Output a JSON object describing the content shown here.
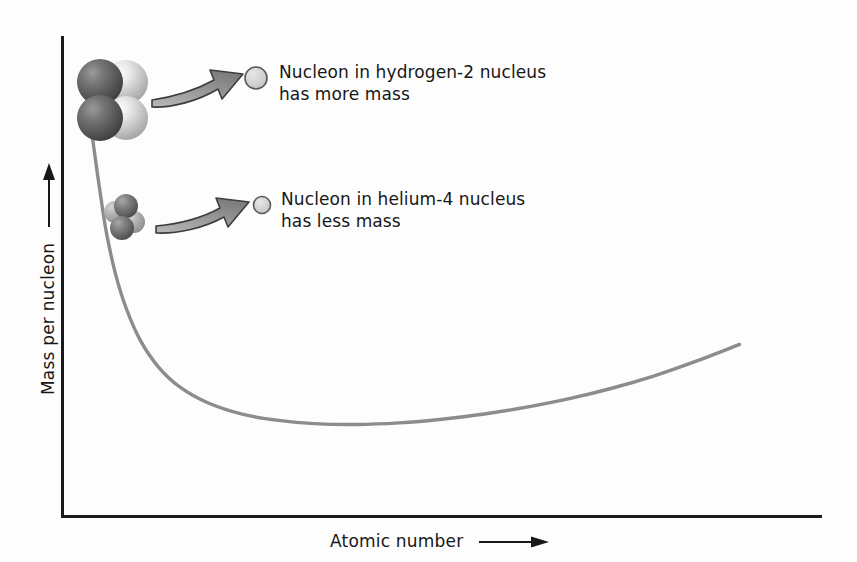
{
  "figure": {
    "background_color": "#fdfdfd",
    "curve_color": "#8c8c8c",
    "axis_color": "#1a1a1a",
    "text_color": "#171717",
    "arrow_fill": "#9a9a9a",
    "arrow_stroke": "#3d3d3d"
  },
  "axes": {
    "y_label": "Mass per nucleon",
    "x_label": "Atomic number",
    "y_arrow": "up-arrow",
    "x_arrow": "right-arrow"
  },
  "annotations": [
    {
      "id": "hydrogen",
      "line1": "Nucleon in hydrogen-2 nucleus",
      "line2": "has more mass",
      "cluster_label": "hydrogen-2-nucleus-cluster",
      "cluster_particles": 4,
      "callout_circle": "single-nucleon-circle-large"
    },
    {
      "id": "helium",
      "line1": "Nucleon in helium-4 nucleus",
      "line2": "has less mass",
      "cluster_label": "helium-4-nucleus-cluster",
      "cluster_particles": 4,
      "callout_circle": "single-nucleon-circle-small"
    }
  ],
  "chart_data": {
    "type": "line",
    "title": "",
    "xlabel": "Atomic number",
    "ylabel": "Mass per nucleon",
    "grid": false,
    "legend": "none",
    "axis_arrows": true,
    "tick_labels": [],
    "xlim": [
      0,
      100
    ],
    "ylim": [
      0,
      100
    ],
    "series": [
      {
        "name": "Mass per nucleon vs atomic number",
        "color": "#8c8c8c",
        "points": [
          [
            1.4,
            96.0
          ],
          [
            2.0,
            88.0
          ],
          [
            2.7,
            80.0
          ],
          [
            3.4,
            71.0
          ],
          [
            4.1,
            62.5
          ],
          [
            4.8,
            55.0
          ],
          [
            6.0,
            45.5
          ],
          [
            7.5,
            37.0
          ],
          [
            9.5,
            29.0
          ],
          [
            12.0,
            22.5
          ],
          [
            15.0,
            17.5
          ],
          [
            19.0,
            13.5
          ],
          [
            24.0,
            10.6
          ],
          [
            29.0,
            9.1
          ],
          [
            34.0,
            8.3
          ],
          [
            40.0,
            8.1
          ],
          [
            46.0,
            8.5
          ],
          [
            52.0,
            9.4
          ],
          [
            58.0,
            10.7
          ],
          [
            64.0,
            12.4
          ],
          [
            70.0,
            14.5
          ],
          [
            76.0,
            17.1
          ],
          [
            82.0,
            20.2
          ],
          [
            88.0,
            23.9
          ],
          [
            94.0,
            28.0
          ]
        ],
        "comment_min": "minimum around atomic number 40"
      }
    ]
  }
}
